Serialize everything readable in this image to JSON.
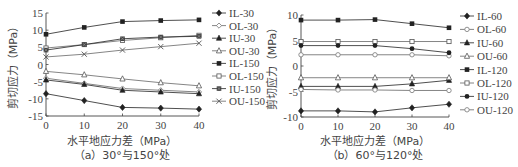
{
  "chart_data": [
    {
      "type": "line",
      "panel": "a",
      "caption": "（a）30°与150°处",
      "xlabel": "水平地应力差（MPa）",
      "ylabel": "剪切应力（MPa）",
      "x": [
        0,
        10,
        20,
        30,
        40
      ],
      "xticks": [
        0,
        10,
        20,
        30,
        40
      ],
      "yticks": [
        15,
        10,
        5,
        0,
        -5,
        -10,
        -15
      ],
      "xlim": [
        0,
        40
      ],
      "ylim": [
        -15,
        15
      ],
      "grid": false,
      "legend_position": "right",
      "series": [
        {
          "name": "IL-30",
          "marker": "diamond-filled",
          "values": [
            -8.5,
            -10.5,
            -12.5,
            -12.7,
            -13.0
          ]
        },
        {
          "name": "OL-30",
          "marker": "diamond-open",
          "values": [
            -4.0,
            -5.5,
            -7.0,
            -7.5,
            -8.0
          ]
        },
        {
          "name": "IU-30",
          "marker": "triangle-filled",
          "values": [
            -4.5,
            -5.8,
            -7.5,
            -8.0,
            -8.5
          ]
        },
        {
          "name": "OU-30",
          "marker": "triangle-open",
          "values": [
            -2.0,
            -3.0,
            -4.2,
            -5.3,
            -6.2
          ]
        },
        {
          "name": "IL-150",
          "marker": "square-filled",
          "values": [
            8.8,
            10.8,
            12.5,
            12.8,
            13.0
          ]
        },
        {
          "name": "OL-150",
          "marker": "square-open",
          "values": [
            4.8,
            5.8,
            7.0,
            7.8,
            8.5
          ]
        },
        {
          "name": "IU-150",
          "marker": "square-x",
          "values": [
            4.2,
            5.8,
            7.5,
            8.0,
            8.2
          ]
        },
        {
          "name": "OU-150",
          "marker": "x",
          "values": [
            2.2,
            3.0,
            4.2,
            5.2,
            6.2
          ]
        }
      ]
    },
    {
      "type": "line",
      "panel": "b",
      "caption": "（b）60°与120°处",
      "xlabel": "水平地应力差（MPa）",
      "ylabel": "剪切应力（MPa）",
      "x": [
        0,
        10,
        20,
        30,
        40
      ],
      "xticks": [
        0,
        10,
        20,
        30,
        40
      ],
      "yticks": [
        10,
        5,
        0,
        -5,
        -10
      ],
      "xlim": [
        0,
        40
      ],
      "ylim": [
        -10,
        10
      ],
      "grid": false,
      "legend_position": "right",
      "series": [
        {
          "name": "IL-60",
          "marker": "diamond-filled",
          "values": [
            -8.8,
            -8.8,
            -9.0,
            -8.2,
            -7.5
          ]
        },
        {
          "name": "OL-60",
          "marker": "circle-open",
          "values": [
            2.2,
            2.2,
            2.2,
            2.2,
            2.0
          ]
        },
        {
          "name": "IU-60",
          "marker": "triangle-filled",
          "values": [
            -4.0,
            -4.0,
            -4.0,
            -3.5,
            -2.8
          ]
        },
        {
          "name": "OU-60",
          "marker": "triangle-open",
          "values": [
            -2.3,
            -2.3,
            -2.3,
            -2.3,
            -2.3
          ]
        },
        {
          "name": "IL-120",
          "marker": "square-filled",
          "values": [
            9.0,
            9.0,
            9.1,
            8.3,
            7.5
          ]
        },
        {
          "name": "OL-120",
          "marker": "square-open",
          "values": [
            4.8,
            4.8,
            4.8,
            4.8,
            4.8
          ]
        },
        {
          "name": "IU-120",
          "marker": "circle-filled",
          "values": [
            4.0,
            4.0,
            4.0,
            3.4,
            2.6
          ]
        },
        {
          "name": "OU-120",
          "marker": "circle-open",
          "values": [
            -4.6,
            -4.7,
            -4.7,
            -4.8,
            -4.8
          ]
        }
      ]
    }
  ]
}
